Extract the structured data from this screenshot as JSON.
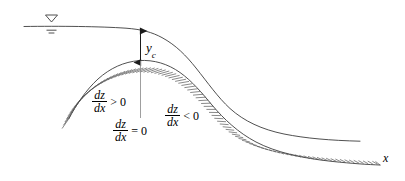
{
  "figure": {
    "type": "open-channel-flow-profile-diagram",
    "colors": {
      "line": "#3c3c3c",
      "hatch": "#4a4a4a",
      "text": "#000000",
      "background": "#ffffff"
    }
  },
  "labels": {
    "critical_depth": {
      "symbol": "y",
      "subscript": "c"
    },
    "axis_x": "x",
    "slope_positive": {
      "numerator": "dz",
      "denominator": "dx",
      "relation": "> 0"
    },
    "slope_zero": {
      "numerator": "dz",
      "denominator": "dx",
      "relation": "= 0"
    },
    "slope_negative": {
      "numerator": "dz",
      "denominator": "dx",
      "relation": "< 0"
    }
  },
  "markers": {
    "free_surface_symbol": "inverted-triangle-with-hatch"
  }
}
